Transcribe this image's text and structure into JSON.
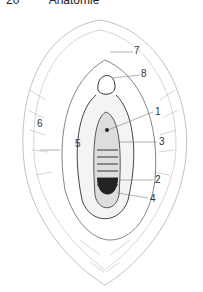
{
  "header": {
    "page_number": "20",
    "running_title": "Anatomie"
  },
  "figure": {
    "labels": [
      {
        "id": "1",
        "text": "1"
      },
      {
        "id": "2",
        "text": "2"
      },
      {
        "id": "3",
        "text": "3"
      },
      {
        "id": "4",
        "text": "4"
      },
      {
        "id": "5",
        "text": "5"
      },
      {
        "id": "6",
        "text": "6"
      },
      {
        "id": "7",
        "text": "7"
      },
      {
        "id": "8",
        "text": "8"
      }
    ]
  }
}
